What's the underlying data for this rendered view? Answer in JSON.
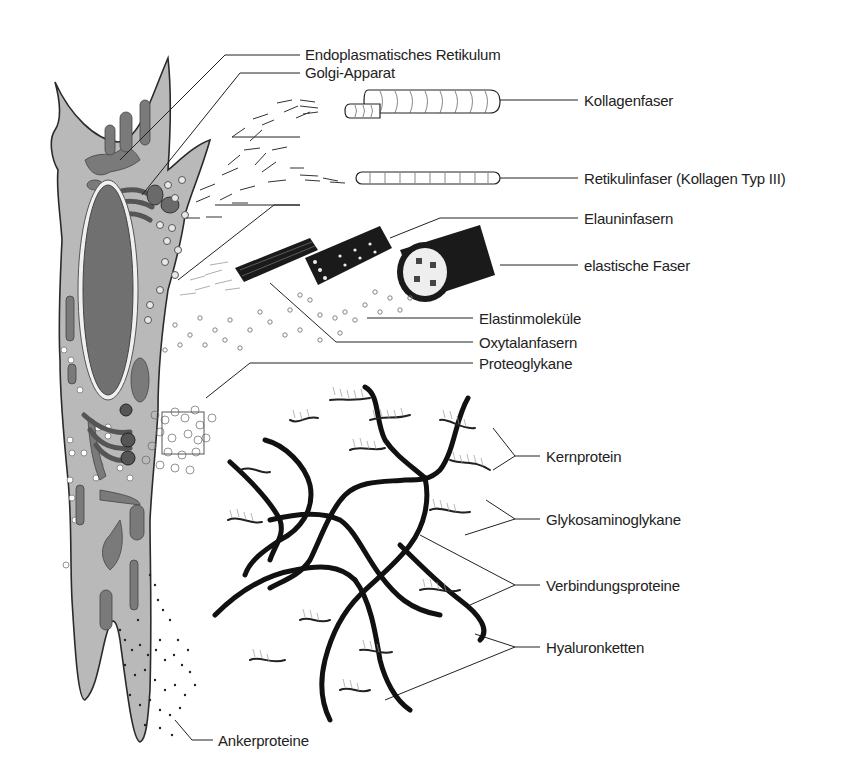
{
  "diagram": {
    "colors": {
      "cell_fill": "#b9b9b9",
      "organelle_fill": "#7a7a7a",
      "nucleus_fill": "#6f6f6f",
      "outline": "#2a2a2a",
      "fiber_dark": "#1a1a1a",
      "background": "#ffffff"
    },
    "labels": {
      "er": "Endoplasmatisches Retikulum",
      "golgi": "Golgi-Apparat",
      "kollagenfaser": "Kollagenfaser",
      "retikulinfaser": "Retikulinfaser (Kollagen Typ III)",
      "elauninfasern": "Elauninfasern",
      "elastische_faser": "elastische Faser",
      "elastinmolekuele": "Elastinmoleküle",
      "oxytalanfasern": "Oxytalanfasern",
      "proteoglykane": "Proteoglykane",
      "kernprotein": "Kernprotein",
      "glykosaminoglykane": "Glykosaminoglykane",
      "verbindungsproteine": "Verbindungsproteine",
      "hyaluronketten": "Hyaluronketten",
      "ankerproteine": "Ankerproteine"
    }
  }
}
